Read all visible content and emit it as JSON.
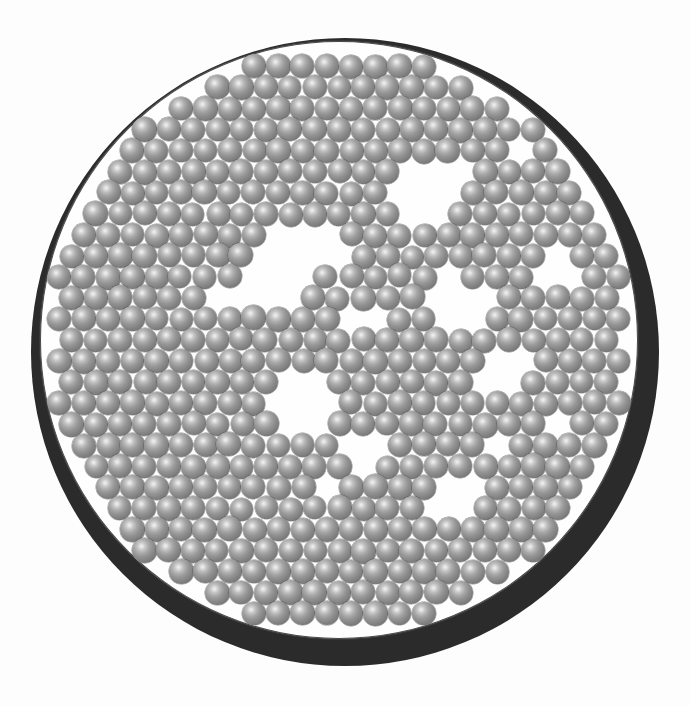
{
  "figure": {
    "domain": "Natural-Image",
    "title": "",
    "background_color": "#fdfdfd"
  },
  "dish": {
    "name": "circular-container",
    "center_x": 345,
    "center_y": 352,
    "inner_radius": 299,
    "wall_color": "#2b2b2b",
    "rim_line_color": "#3a3a3a",
    "floor_color": "#fefefe",
    "wall_thickness_min": 2,
    "wall_thickness_max": 15,
    "wall_offset_x": 6,
    "wall_offset_y": 12
  },
  "beads": {
    "name": "sphere-packing",
    "count": 1180,
    "diameter": 24,
    "highlight_color": "#f2f2f2",
    "body_color": "#949494",
    "edge_color": "#4a4a4a",
    "highlight_position": "38% 33%",
    "packing_seed": 20240607,
    "lattice_spacing": 24.3,
    "jitter": 1.9
  },
  "voids": [
    {
      "name": "void-upper-centre",
      "cx": 300,
      "cy": 262,
      "rx": 58,
      "ry": 44,
      "rot": -22
    },
    {
      "name": "void-upper-right",
      "cx": 432,
      "cy": 186,
      "rx": 40,
      "ry": 34,
      "rot": 15
    },
    {
      "name": "void-mid-right",
      "cx": 455,
      "cy": 300,
      "rx": 30,
      "ry": 26,
      "rot": 0
    },
    {
      "name": "void-centre",
      "cx": 300,
      "cy": 400,
      "rx": 36,
      "ry": 32,
      "rot": 10
    },
    {
      "name": "void-lower-centre",
      "cx": 372,
      "cy": 446,
      "rx": 26,
      "ry": 22,
      "rot": 0
    },
    {
      "name": "void-right-band",
      "cx": 506,
      "cy": 374,
      "rx": 34,
      "ry": 26,
      "rot": -35
    },
    {
      "name": "void-lower-right",
      "cx": 452,
      "cy": 500,
      "rx": 30,
      "ry": 24,
      "rot": -20
    },
    {
      "name": "void-right-edge",
      "cx": 556,
      "cy": 262,
      "rx": 24,
      "ry": 20,
      "rot": 0
    },
    {
      "name": "void-upper-band",
      "cx": 368,
      "cy": 318,
      "rx": 22,
      "ry": 18,
      "rot": 0
    },
    {
      "name": "void-upper-left-arc",
      "cx": 236,
      "cy": 300,
      "rx": 20,
      "ry": 16,
      "rot": 0
    },
    {
      "name": "void-ne-rim",
      "cx": 520,
      "cy": 150,
      "rx": 22,
      "ry": 18,
      "rot": 0
    },
    {
      "name": "void-se-small",
      "cx": 500,
      "cy": 454,
      "rx": 18,
      "ry": 16,
      "rot": 0
    },
    {
      "name": "void-sw-small",
      "cx": 330,
      "cy": 480,
      "rx": 18,
      "ry": 15,
      "rot": 0
    },
    {
      "name": "void-e-small",
      "cx": 556,
      "cy": 430,
      "rx": 16,
      "ry": 14,
      "rot": 0
    }
  ]
}
